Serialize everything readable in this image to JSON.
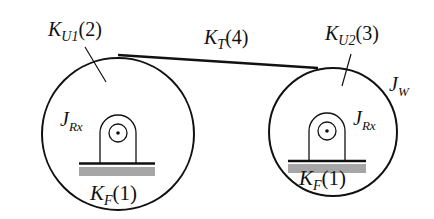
{
  "diagram": {
    "type": "belt-drive schematic",
    "colors": {
      "stroke": "#111111",
      "base_fill": "#a6a6a6"
    },
    "labels": {
      "ku1": {
        "main": "K",
        "sub": "U1",
        "tail": "(2)"
      },
      "kt": {
        "main": "K",
        "sub": "T",
        "tail": "(4)"
      },
      "ku2": {
        "main": "K",
        "sub": "U2",
        "tail": "(3)"
      },
      "jw": {
        "main": "J",
        "sub": "W"
      },
      "jrx_left": {
        "main": "J",
        "sub": "Rx"
      },
      "jrx_right": {
        "main": "J",
        "sub": "Rx"
      },
      "kf_left": {
        "main": "K",
        "sub": "F",
        "tail": "(1)"
      },
      "kf_right": {
        "main": "K",
        "sub": "F",
        "tail": "(1)"
      }
    }
  }
}
